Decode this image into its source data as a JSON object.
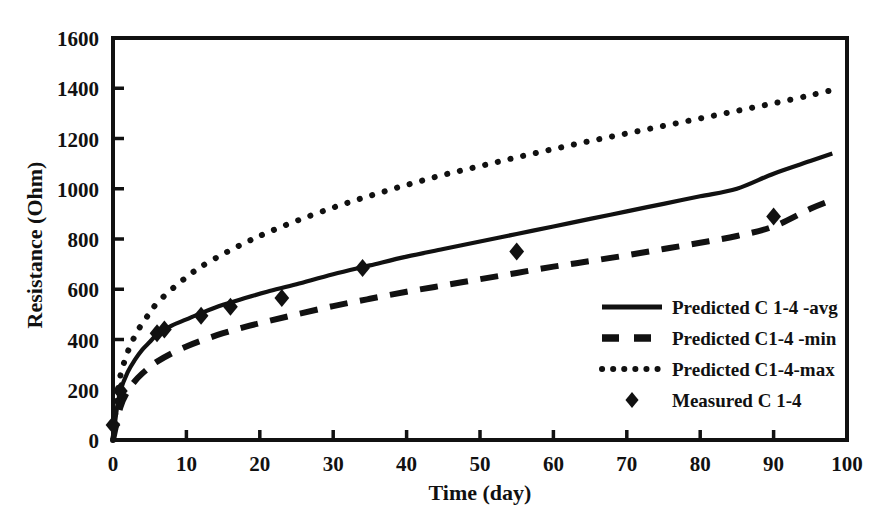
{
  "chart_data": {
    "type": "line",
    "title": "",
    "xlabel": "Time (day)",
    "ylabel": "Resistance (Ohm)",
    "xlim": [
      0,
      100
    ],
    "ylim": [
      0,
      1600
    ],
    "xticks": [
      0,
      10,
      20,
      30,
      40,
      50,
      60,
      70,
      80,
      90,
      100
    ],
    "yticks": [
      0,
      200,
      400,
      600,
      800,
      1000,
      1200,
      1400,
      1600
    ],
    "grid": false,
    "legend_position": "center-right",
    "axis_color": "#111111",
    "series": [
      {
        "name": "Predicted C 1-4 -avg",
        "style": "solid",
        "color": "#111111",
        "x": [
          0,
          0.5,
          1,
          2,
          3,
          4,
          5,
          6,
          8,
          10,
          12,
          15,
          18,
          21,
          25,
          30,
          35,
          40,
          45,
          50,
          55,
          60,
          65,
          70,
          75,
          80,
          85,
          90,
          95,
          98
        ],
        "y": [
          0,
          120,
          195,
          270,
          320,
          360,
          390,
          420,
          455,
          480,
          505,
          538,
          565,
          590,
          620,
          660,
          695,
          730,
          760,
          790,
          820,
          850,
          880,
          910,
          940,
          970,
          1000,
          1060,
          1110,
          1140
        ]
      },
      {
        "name": "Predicted C1-4 -min",
        "style": "dashed",
        "color": "#111111",
        "x": [
          0,
          1,
          2,
          3,
          4,
          5,
          6,
          8,
          10,
          12,
          15,
          18,
          21,
          25,
          30,
          35,
          40,
          45,
          50,
          55,
          60,
          65,
          70,
          75,
          80,
          85,
          90,
          95,
          98
        ],
        "y": [
          0,
          130,
          195,
          235,
          265,
          290,
          312,
          345,
          372,
          395,
          425,
          450,
          472,
          500,
          533,
          562,
          590,
          615,
          640,
          665,
          690,
          712,
          735,
          760,
          785,
          812,
          850,
          920,
          955
        ]
      },
      {
        "name": "Predicted C1-4-max",
        "style": "dotted",
        "color": "#111111",
        "x": [
          0,
          0.5,
          1,
          2,
          3,
          4,
          5,
          6,
          8,
          10,
          12,
          15,
          18,
          21,
          25,
          30,
          35,
          40,
          45,
          50,
          55,
          60,
          65,
          70,
          75,
          80,
          85,
          90,
          95,
          99
        ],
        "y": [
          0,
          160,
          255,
          350,
          415,
          465,
          505,
          545,
          600,
          648,
          690,
          740,
          785,
          825,
          872,
          925,
          972,
          1015,
          1055,
          1090,
          1125,
          1158,
          1190,
          1220,
          1250,
          1280,
          1310,
          1340,
          1372,
          1400
        ]
      }
    ],
    "points": {
      "name": "Measured C 1-4",
      "marker": "diamond",
      "color": "#111111",
      "x": [
        0,
        1,
        6,
        7,
        12,
        16,
        23,
        34,
        55,
        90
      ],
      "y": [
        60,
        195,
        425,
        440,
        495,
        530,
        565,
        685,
        750,
        890
      ]
    }
  },
  "legend": {
    "items": [
      {
        "label": "Predicted C 1-4 -avg",
        "style": "solid"
      },
      {
        "label": "Predicted C1-4 -min",
        "style": "dashed"
      },
      {
        "label": "Predicted C1-4-max",
        "style": "dotted"
      },
      {
        "label": "Measured C 1-4",
        "style": "diamond"
      }
    ]
  }
}
